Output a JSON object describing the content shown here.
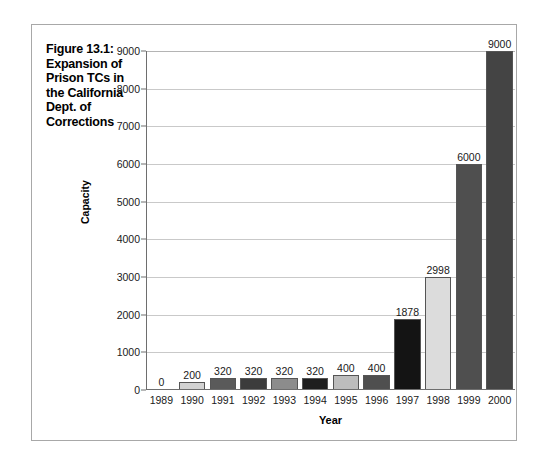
{
  "figure": {
    "title": "Figure 13.1: Expansion of Prison TCs in the California Dept. of Corrections"
  },
  "chart_data": {
    "type": "bar",
    "title": "Figure 13.1: Expansion of Prison TCs in the California Dept. of Corrections",
    "xlabel": "Year",
    "ylabel": "Capacity",
    "categories": [
      "1989",
      "1990",
      "1991",
      "1992",
      "1993",
      "1994",
      "1995",
      "1996",
      "1997",
      "1998",
      "1999",
      "2000"
    ],
    "values": [
      0,
      200,
      320,
      320,
      320,
      320,
      400,
      400,
      1878,
      2998,
      6000,
      9000
    ],
    "value_labels": [
      "0",
      "200",
      "320",
      "320",
      "320",
      "320",
      "400",
      "400",
      "1878",
      "2998",
      "6000",
      "9000"
    ],
    "bar_colors": [
      "#ffffff",
      "#d2d2d2",
      "#5a5a5a",
      "#3c3c3c",
      "#8c8c8c",
      "#1e1e1e",
      "#bdbdbd",
      "#4f4f4f",
      "#141414",
      "#dcdcdc",
      "#4f4f4f",
      "#444444"
    ],
    "ylim": [
      0,
      9000
    ],
    "yticks": [
      0,
      1000,
      2000,
      3000,
      4000,
      5000,
      6000,
      7000,
      8000,
      9000
    ],
    "ytick_labels": [
      "0",
      "1000",
      "2000",
      "3000",
      "4000",
      "5000",
      "6000",
      "7000",
      "8000",
      "9000"
    ],
    "grid": true,
    "legend": false,
    "gridline_color": "#c9c9c9",
    "axis_color": "#6e6e6e",
    "background": "#ffffff"
  }
}
